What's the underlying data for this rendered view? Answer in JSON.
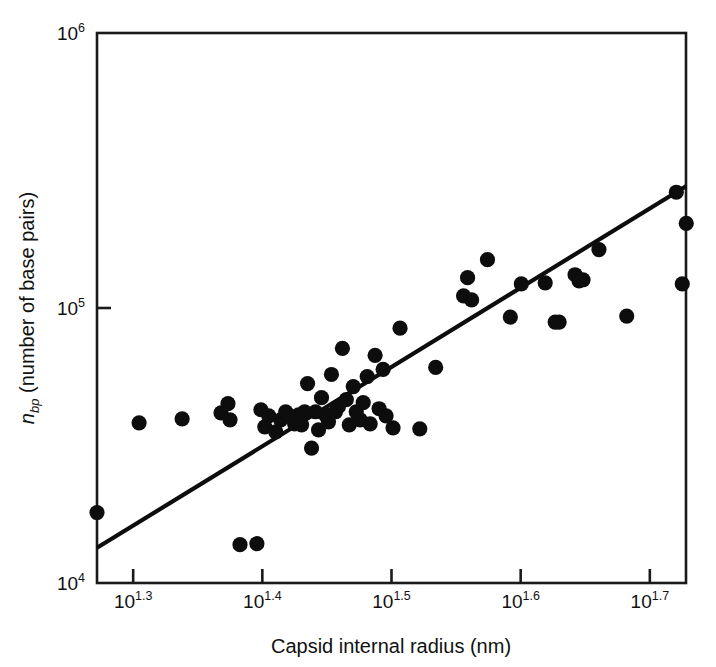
{
  "chart_data": {
    "type": "scatter",
    "title": "",
    "xlabel": "Capsid internal radius (nm)",
    "ylabel": "n_bp (number of base pairs)",
    "ylabel_parts": {
      "symbol": "n",
      "subscript": "bp",
      "rest": " (number of base pairs)"
    },
    "x_scale": "log10",
    "y_scale": "log10",
    "xlim_log": [
      1.272,
      1.728
    ],
    "ylim_log": [
      4.0,
      6.0
    ],
    "xticks_log": [
      1.3,
      1.4,
      1.5,
      1.6,
      1.7
    ],
    "xtick_labels": [
      "10^1.3",
      "10^1.4",
      "10^1.5",
      "10^1.6",
      "10^1.7"
    ],
    "xtick_mantissa": "10",
    "xtick_exponents": [
      "1.3",
      "1.4",
      "1.5",
      "1.6",
      "1.7"
    ],
    "yticks_log": [
      4.0,
      5.0,
      6.0
    ],
    "ytick_labels": [
      "10^4",
      "10^5",
      "10^6"
    ],
    "ytick_mantissa": "10",
    "ytick_exponents": [
      "4",
      "5",
      "6"
    ],
    "grid": false,
    "legend": null,
    "marker": "filled-circle",
    "marker_color": "#0d0d0d",
    "marker_radius_px": 7.6,
    "frame": "full-box",
    "fit_line": {
      "label": "power-law fit",
      "color": "#0d0d0d",
      "width_px": 4.2,
      "x_log": [
        1.272,
        1.728
      ],
      "y_log": [
        4.128,
        5.443
      ],
      "slope_loglog": 2.883
    },
    "points_log": [
      [
        1.272,
        4.2563
      ],
      [
        1.3046,
        4.5824
      ],
      [
        1.3379,
        4.597
      ],
      [
        1.368,
        4.619
      ],
      [
        1.3734,
        4.652
      ],
      [
        1.375,
        4.5934
      ],
      [
        1.3827,
        4.1392
      ],
      [
        1.3958,
        4.1429
      ],
      [
        1.3989,
        4.63
      ],
      [
        1.4019,
        4.5678
      ],
      [
        1.405,
        4.608
      ],
      [
        1.4104,
        4.5495
      ],
      [
        1.4142,
        4.5934
      ],
      [
        1.4181,
        4.6227
      ],
      [
        1.4212,
        4.608
      ],
      [
        1.425,
        4.5788
      ],
      [
        1.4281,
        4.6117
      ],
      [
        1.4304,
        4.5751
      ],
      [
        1.4327,
        4.6227
      ],
      [
        1.435,
        4.7253
      ],
      [
        1.4381,
        4.4908
      ],
      [
        1.4412,
        4.6227
      ],
      [
        1.4435,
        4.5568
      ],
      [
        1.4458,
        4.6739
      ],
      [
        1.4489,
        4.6117
      ],
      [
        1.4512,
        4.5861
      ],
      [
        1.4535,
        4.7582
      ],
      [
        1.4566,
        4.6227
      ],
      [
        1.4589,
        4.641
      ],
      [
        1.462,
        4.8535
      ],
      [
        1.465,
        4.6666
      ],
      [
        1.4673,
        4.5751
      ],
      [
        1.4704,
        4.7143
      ],
      [
        1.4727,
        4.6227
      ],
      [
        1.4758,
        4.5934
      ],
      [
        1.4781,
        4.6556
      ],
      [
        1.4812,
        4.7509
      ],
      [
        1.4835,
        4.5788
      ],
      [
        1.4873,
        4.8278
      ],
      [
        1.4904,
        4.6337
      ],
      [
        1.4935,
        4.7766
      ],
      [
        1.4958,
        4.608
      ],
      [
        1.5012,
        4.5641
      ],
      [
        1.5066,
        4.9268
      ],
      [
        1.5219,
        4.5605
      ],
      [
        1.5342,
        4.7839
      ],
      [
        1.5558,
        5.0441
      ],
      [
        1.5589,
        5.1101
      ],
      [
        1.562,
        5.0294
      ],
      [
        1.5743,
        5.1759
      ],
      [
        1.592,
        4.9671
      ],
      [
        1.6005,
        5.088
      ],
      [
        1.619,
        5.0917
      ],
      [
        1.6267,
        4.9488
      ],
      [
        1.6298,
        4.9488
      ],
      [
        1.6421,
        5.121
      ],
      [
        1.6452,
        5.099
      ],
      [
        1.6483,
        5.1027
      ],
      [
        1.6606,
        5.2126
      ],
      [
        1.6821,
        4.9707
      ],
      [
        1.7251,
        5.088
      ],
      [
        1.7205,
        5.421
      ],
      [
        1.7282,
        5.3075
      ]
    ]
  },
  "axes": {
    "x_title": "Capsid internal radius (nm)",
    "y_title_symbol": "n",
    "y_title_sub": "bp",
    "y_title_rest": " (number of base pairs)"
  },
  "colors": {
    "background": "#ffffff",
    "ink": "#111111",
    "marker": "#0d0d0d",
    "line": "#0d0d0d"
  }
}
